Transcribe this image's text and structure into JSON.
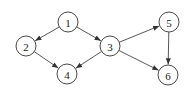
{
  "graph": {
    "type": "directed",
    "nodes": [
      {
        "id": "1",
        "label": "1",
        "x": 68,
        "y": 22
      },
      {
        "id": "2",
        "label": "2",
        "x": 26,
        "y": 46
      },
      {
        "id": "3",
        "label": "3",
        "x": 110,
        "y": 46
      },
      {
        "id": "4",
        "label": "4",
        "x": 67,
        "y": 74
      },
      {
        "id": "5",
        "label": "5",
        "x": 169,
        "y": 22
      },
      {
        "id": "6",
        "label": "6",
        "x": 168,
        "y": 75
      }
    ],
    "edges": [
      {
        "from": "1",
        "to": "2"
      },
      {
        "from": "1",
        "to": "3"
      },
      {
        "from": "2",
        "to": "4"
      },
      {
        "from": "3",
        "to": "4"
      },
      {
        "from": "3",
        "to": "5"
      },
      {
        "from": "3",
        "to": "6"
      },
      {
        "from": "5",
        "to": "6"
      }
    ],
    "node_radius": 10,
    "colors": {
      "stroke": "#333333",
      "fill": "#ffffff",
      "text": "#222222"
    }
  }
}
